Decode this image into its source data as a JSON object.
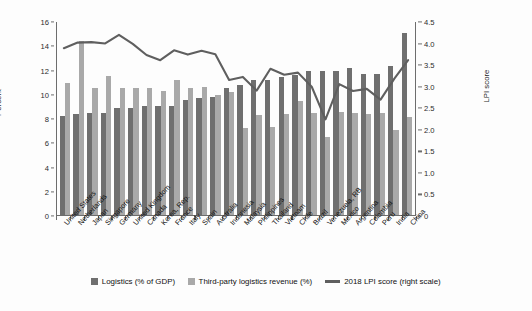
{
  "axes": {
    "left_title": "Percent",
    "left_ticks": [
      "16",
      "14",
      "12",
      "10",
      "8",
      "6",
      "4",
      "2",
      "0"
    ],
    "right_title": "LPI score",
    "right_ticks": [
      "4.5",
      "4.0",
      "3.5",
      "3.0",
      "2.5",
      "2.0",
      "1.5",
      "1.0",
      "0.5",
      "0"
    ]
  },
  "legend": {
    "items": [
      {
        "label": "Logistics (% of GDP)",
        "color": "#6f6f6f",
        "type": "swatch"
      },
      {
        "label": "Third-party logistics revenue (%)",
        "color": "#a9a9a9",
        "type": "swatch"
      },
      {
        "label": "2018 LPI score (right scale)",
        "color": "#5f5f5f",
        "type": "line"
      }
    ]
  },
  "chart_data": {
    "type": "bar",
    "title": "",
    "subtitle": "",
    "xlabel": "",
    "ylabel": "Percent",
    "y2label": "LPI score",
    "ylim": [
      0,
      16
    ],
    "y2lim": [
      0,
      4.5
    ],
    "grid": false,
    "legend_position": "bottom",
    "categories": [
      "United States",
      "Netherlands",
      "Japan",
      "Singapore",
      "Germany",
      "United Kingdom",
      "Canada",
      "Korea, Rep.",
      "France",
      "Italy",
      "Spain",
      "Australia",
      "Indonesia",
      "Malaysia",
      "Philippines",
      "Thailand",
      "Vietnam",
      "Chile",
      "Brazil",
      "Venezuela, RB",
      "Mexico",
      "Argentina",
      "Colombia",
      "Peru",
      "India",
      "China"
    ],
    "series": [
      {
        "name": "Logistics (% of GDP)",
        "axis": "left",
        "color": "#6f6f6f",
        "values": [
          8.2,
          8.3,
          8.4,
          8.4,
          8.8,
          8.8,
          8.95,
          8.95,
          9.0,
          9.45,
          9.65,
          9.7,
          10.5,
          10.7,
          11.1,
          11.1,
          11.4,
          11.55,
          11.85,
          11.9,
          11.85,
          12.15,
          11.6,
          11.65,
          12.3,
          15.05
        ]
      },
      {
        "name": "Third-party logistics revenue (%)",
        "axis": "left",
        "color": "#a9a9a9",
        "values": [
          10.9,
          14.35,
          10.5,
          11.5,
          10.45,
          10.5,
          10.5,
          10.2,
          11.1,
          10.45,
          10.55,
          9.9,
          10.15,
          7.15,
          8.25,
          7.3,
          8.3,
          9.4,
          8.4,
          6.4,
          8.5,
          8.4,
          8.35,
          8.45,
          7.05,
          8.05
        ]
      },
      {
        "name": "2018 LPI score (right scale)",
        "axis": "right",
        "color": "#5f5f5f",
        "values": [
          3.89,
          4.02,
          4.03,
          4.0,
          4.2,
          3.99,
          3.73,
          3.61,
          3.84,
          3.74,
          3.83,
          3.75,
          3.15,
          3.22,
          2.9,
          3.41,
          3.27,
          3.32,
          2.99,
          2.23,
          3.05,
          2.89,
          2.94,
          2.69,
          3.18,
          3.61
        ]
      }
    ]
  }
}
